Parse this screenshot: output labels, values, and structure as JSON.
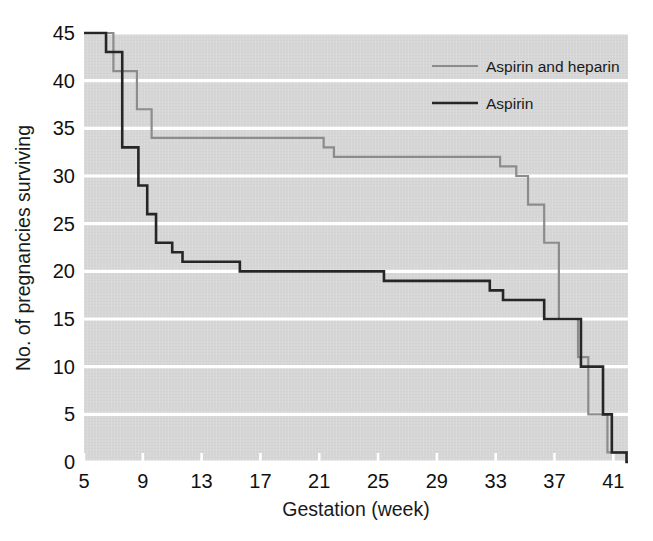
{
  "chart_data": {
    "type": "line",
    "subtype": "kaplan-meier-step",
    "title": "",
    "xlabel": "Gestation (week)",
    "ylabel": "No. of pregnancies surviving",
    "xlim": [
      5,
      42
    ],
    "ylim": [
      0,
      45
    ],
    "xticks": [
      5,
      9,
      13,
      17,
      21,
      25,
      29,
      33,
      37,
      41
    ],
    "xtick_labels": [
      "5",
      "9",
      "13",
      "17",
      "21",
      "25",
      "29",
      "33",
      "37",
      "41"
    ],
    "yticks": [
      0,
      5,
      10,
      15,
      20,
      25,
      30,
      35,
      40,
      45
    ],
    "ytick_labels": [
      "0",
      "5",
      "10",
      "15",
      "20",
      "25",
      "30",
      "35",
      "40",
      "45"
    ],
    "grid": "horizontal-white-gridlines",
    "plot_background": "#d6d6d6",
    "legend_position": "top-right",
    "series": [
      {
        "name": "Aspirin and heparin",
        "color": "#8c8c8c",
        "line_width": 2.2,
        "steps": [
          {
            "x": 5.0,
            "y": 45
          },
          {
            "x": 7.0,
            "y": 45
          },
          {
            "x": 7.0,
            "y": 41
          },
          {
            "x": 8.6,
            "y": 41
          },
          {
            "x": 8.6,
            "y": 37
          },
          {
            "x": 9.6,
            "y": 37
          },
          {
            "x": 9.6,
            "y": 34
          },
          {
            "x": 21.3,
            "y": 34
          },
          {
            "x": 21.3,
            "y": 33
          },
          {
            "x": 22.0,
            "y": 33
          },
          {
            "x": 22.0,
            "y": 32
          },
          {
            "x": 33.3,
            "y": 32
          },
          {
            "x": 33.3,
            "y": 31
          },
          {
            "x": 34.4,
            "y": 31
          },
          {
            "x": 34.4,
            "y": 30
          },
          {
            "x": 35.2,
            "y": 30
          },
          {
            "x": 35.2,
            "y": 27
          },
          {
            "x": 36.3,
            "y": 27
          },
          {
            "x": 36.3,
            "y": 23
          },
          {
            "x": 37.3,
            "y": 23
          },
          {
            "x": 37.3,
            "y": 15
          },
          {
            "x": 38.6,
            "y": 15
          },
          {
            "x": 38.6,
            "y": 11
          },
          {
            "x": 39.3,
            "y": 11
          },
          {
            "x": 39.3,
            "y": 5
          },
          {
            "x": 40.6,
            "y": 5
          },
          {
            "x": 40.6,
            "y": 1
          },
          {
            "x": 42.0,
            "y": 1
          }
        ]
      },
      {
        "name": "Aspirin",
        "color": "#262626",
        "line_width": 2.6,
        "steps": [
          {
            "x": 5.0,
            "y": 45
          },
          {
            "x": 6.5,
            "y": 45
          },
          {
            "x": 6.5,
            "y": 43
          },
          {
            "x": 7.6,
            "y": 43
          },
          {
            "x": 7.6,
            "y": 33
          },
          {
            "x": 8.7,
            "y": 33
          },
          {
            "x": 8.7,
            "y": 29
          },
          {
            "x": 9.3,
            "y": 29
          },
          {
            "x": 9.3,
            "y": 26
          },
          {
            "x": 9.9,
            "y": 26
          },
          {
            "x": 9.9,
            "y": 23
          },
          {
            "x": 11.0,
            "y": 23
          },
          {
            "x": 11.0,
            "y": 22
          },
          {
            "x": 11.7,
            "y": 22
          },
          {
            "x": 11.7,
            "y": 21
          },
          {
            "x": 15.6,
            "y": 21
          },
          {
            "x": 15.6,
            "y": 20
          },
          {
            "x": 25.4,
            "y": 20
          },
          {
            "x": 25.4,
            "y": 19
          },
          {
            "x": 32.6,
            "y": 19
          },
          {
            "x": 32.6,
            "y": 18
          },
          {
            "x": 33.5,
            "y": 18
          },
          {
            "x": 33.5,
            "y": 17
          },
          {
            "x": 36.3,
            "y": 17
          },
          {
            "x": 36.3,
            "y": 15
          },
          {
            "x": 38.8,
            "y": 15
          },
          {
            "x": 38.8,
            "y": 10
          },
          {
            "x": 40.3,
            "y": 10
          },
          {
            "x": 40.3,
            "y": 5
          },
          {
            "x": 40.9,
            "y": 5
          },
          {
            "x": 40.9,
            "y": 1
          },
          {
            "x": 41.9,
            "y": 1
          },
          {
            "x": 41.9,
            "y": 0
          },
          {
            "x": 42.0,
            "y": 0
          }
        ]
      }
    ]
  },
  "legend": {
    "items": [
      {
        "label": "Aspirin and heparin",
        "color": "#8c8c8c"
      },
      {
        "label": "Aspirin",
        "color": "#262626"
      }
    ]
  },
  "axes": {
    "x_label": "Gestation (week)",
    "y_label": "No. of pregnancies surviving"
  }
}
